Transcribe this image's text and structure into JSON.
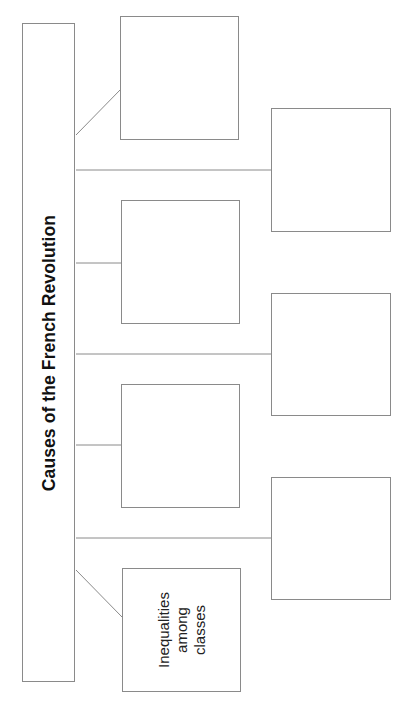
{
  "diagram": {
    "title": "Causes of the French Revolution",
    "orientation": "rotated-90-ccw",
    "colors": {
      "line": "#8a8a8a",
      "text": "#111111",
      "background": "#ffffff"
    },
    "causes": [
      {
        "id": "cause-1",
        "column": "inner",
        "label": ""
      },
      {
        "id": "cause-2",
        "column": "outer",
        "label": ""
      },
      {
        "id": "cause-3",
        "column": "inner",
        "label": ""
      },
      {
        "id": "cause-4",
        "column": "outer",
        "label": ""
      },
      {
        "id": "cause-5",
        "column": "inner",
        "label": ""
      },
      {
        "id": "cause-6",
        "column": "outer",
        "label": ""
      },
      {
        "id": "cause-7",
        "column": "inner",
        "label": "Inequalities\namong\nclasses"
      }
    ],
    "filled_cause_lines": [
      "Inequalities",
      "among",
      "classes"
    ]
  }
}
